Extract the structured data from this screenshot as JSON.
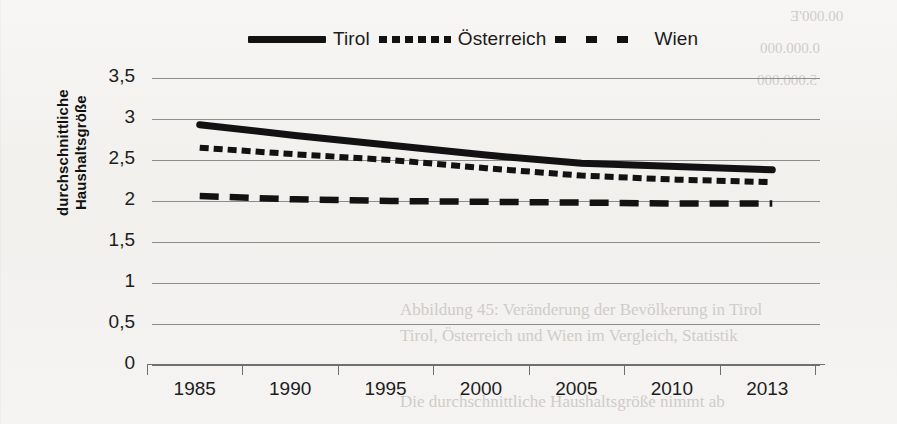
{
  "figure": {
    "y_axis_title_line1": "durchschnittliche",
    "y_axis_title_line2": "Haushaltsgröße"
  },
  "legend": {
    "position": "top-center",
    "entries": [
      {
        "label": "Tirol",
        "style": "solid",
        "swatch": "legend-swatch-solid"
      },
      {
        "label": "Österreich",
        "style": "dotted",
        "swatch": "legend-swatch-dotted"
      },
      {
        "label": "Wien",
        "style": "dashed",
        "swatch": "legend-swatch-dashed"
      }
    ]
  },
  "y_ticks": [
    "3,5",
    "3",
    "2,5",
    "2",
    "1,5",
    "1",
    "0,5",
    "0"
  ],
  "background_bleed": [
    {
      "text": "00.000'E",
      "x": 790,
      "y": 8,
      "size": 15,
      "mirror": true
    },
    {
      "text": "0.000.000",
      "x": 760,
      "y": 40,
      "size": 15,
      "mirror": true
    },
    {
      "text": "5.000.000",
      "x": 757,
      "y": 72,
      "size": 15,
      "mirror": true
    },
    {
      "text": "Abbildung 45: Veränderung der Bevölkerung in Tirol",
      "x": 400,
      "y": 300,
      "size": 17,
      "mirror": false
    },
    {
      "text": "Tirol, Österreich und Wien im Vergleich, Statistik",
      "x": 400,
      "y": 326,
      "size": 17,
      "mirror": false
    },
    {
      "text": "Die durchschnittliche Haushaltsgröße nimmt ab",
      "x": 400,
      "y": 392,
      "size": 17,
      "mirror": false
    }
  ],
  "chart_data": {
    "type": "line",
    "title": "",
    "xlabel": "",
    "ylabel": "durchschnittliche Haushaltsgröße",
    "categories": [
      "1985",
      "1990",
      "1995",
      "2000",
      "2005",
      "2010",
      "2013"
    ],
    "ylim": [
      0,
      3.5
    ],
    "ytick_step": 0.5,
    "grid": true,
    "legend_position": "top-center",
    "decimal_separator": ",",
    "series": [
      {
        "name": "Tirol",
        "style": "solid",
        "color": "#121212",
        "values": [
          2.93,
          2.8,
          2.68,
          2.56,
          2.46,
          2.42,
          2.38
        ]
      },
      {
        "name": "Österreich",
        "style": "dotted",
        "color": "#121212",
        "values": [
          2.65,
          2.57,
          2.5,
          2.4,
          2.31,
          2.26,
          2.23
        ]
      },
      {
        "name": "Wien",
        "style": "dashed",
        "color": "#121212",
        "values": [
          2.06,
          2.02,
          2.0,
          1.99,
          1.98,
          1.97,
          1.97
        ]
      }
    ]
  }
}
